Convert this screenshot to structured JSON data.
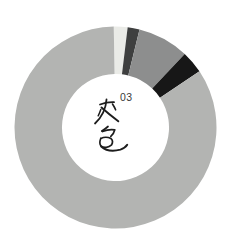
{
  "chart_data": {
    "type": "pie",
    "subtype": "donut",
    "title": "",
    "center_label": "灰色",
    "center_superscript": "03",
    "direction": "clockwise",
    "start_angle_deg": -1,
    "donut_hole_ratio": 0.53,
    "background_color": "#ffffff",
    "legend": "none",
    "slices": [
      {
        "name": "off-white",
        "value": 2.2,
        "color": "#eaebe7"
      },
      {
        "name": "charcoal",
        "value": 1.9,
        "color": "#3e3f3f"
      },
      {
        "name": "mid-gray",
        "value": 8.2,
        "color": "#8d8e8e"
      },
      {
        "name": "black",
        "value": 3.6,
        "color": "#171717"
      },
      {
        "name": "main-gray",
        "value": 84.1,
        "color": "#b3b4b2"
      }
    ],
    "center_label_color": "#1d1d1d"
  }
}
